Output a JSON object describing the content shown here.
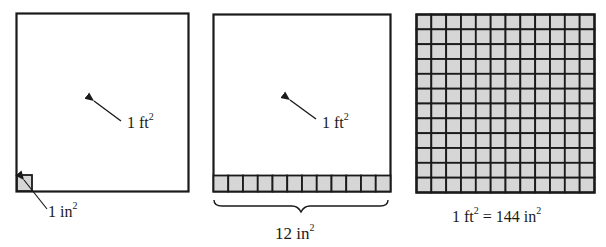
{
  "colors": {
    "stroke": "#1a1a1a",
    "cell_fill": "#d6d6d6",
    "background": "#ffffff"
  },
  "panels": [
    {
      "id": "panel-1",
      "big_square_label": "1 ft",
      "big_square_exp": "2",
      "small_square_label": "1 in",
      "small_square_exp": "2"
    },
    {
      "id": "panel-2",
      "big_square_label": "1 ft",
      "big_square_exp": "2",
      "strip_cells": 12,
      "brace_label": "12 in",
      "brace_label_exp": "2"
    },
    {
      "id": "panel-3",
      "grid_rows": 12,
      "grid_cols": 12,
      "equation_lhs": "1 ft",
      "equation_lhs_exp": "2",
      "equation_eq": " = 144 in",
      "equation_rhs_exp": "2"
    }
  ]
}
